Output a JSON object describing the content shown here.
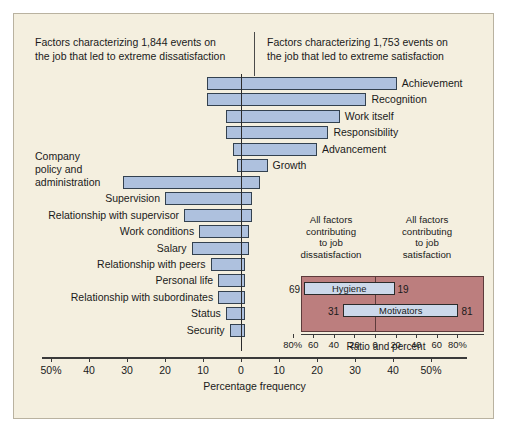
{
  "header": {
    "left": "Factors characterizing 1,844 events on\nthe job that led to extreme dissatisfaction",
    "right": "Factors characterizing 1,753 events on\nthe job that led to extreme satisfaction"
  },
  "axis": {
    "title": "Percentage frequency",
    "ticks": [
      "50%",
      "40",
      "30",
      "20",
      "10",
      "0",
      "10",
      "20",
      "30",
      "40",
      "50%"
    ]
  },
  "inset": {
    "caption_left": "All factors\ncontributing\nto job\ndissatisfaction",
    "caption_right": "All factors\ncontributing\nto job\nsatisfaction",
    "title": "Ratio and percent",
    "ticks": [
      "80%",
      "60",
      "40",
      "20",
      "0",
      "20",
      "40",
      "60",
      "80%"
    ],
    "bars": [
      {
        "label": "Hygiene",
        "left_value": 69,
        "right_value": 19
      },
      {
        "label": "Motivators",
        "left_value": 31,
        "right_value": 81
      }
    ]
  },
  "colors": {
    "panel_background": "#f4efdf",
    "bar_fill": "#aec1de",
    "bar_stroke": "#33414f",
    "inset_background": "#bc7e7e",
    "inset_bar_fill": "#ccd8ea",
    "axis": "#3a3a3a"
  },
  "chart_data": {
    "type": "bar",
    "orientation": "horizontal-diverging",
    "xlabel": "Percentage frequency",
    "ylabel": "",
    "xlim": [
      -50,
      50
    ],
    "grid": false,
    "legend": "none",
    "note": "Each factor spans from a dissatisfaction percentage (left of zero, negative) to a satisfaction percentage (right of zero, positive).",
    "categories": [
      "Achievement",
      "Recognition",
      "Work itself",
      "Responsibility",
      "Advancement",
      "Growth",
      "Company policy and administration",
      "Supervision",
      "Relationship with supervisor",
      "Work conditions",
      "Salary",
      "Relationship with peers",
      "Personal life",
      "Relationship with subordinates",
      "Status",
      "Security"
    ],
    "series": [
      {
        "name": "Dissatisfaction (left of zero, %)",
        "values": [
          9,
          9,
          4,
          4,
          2,
          1,
          31,
          20,
          15,
          11,
          13,
          8,
          6,
          6,
          4,
          3
        ]
      },
      {
        "name": "Satisfaction (right of zero, %)",
        "values": [
          41,
          33,
          26,
          23,
          20,
          7,
          5,
          3,
          3,
          2,
          2,
          1,
          1,
          1,
          1,
          1
        ]
      }
    ],
    "label_side": [
      "right",
      "right",
      "right",
      "right",
      "right",
      "right",
      "left",
      "left",
      "left",
      "left",
      "left",
      "left",
      "left",
      "left",
      "left",
      "left"
    ],
    "inset_chart": {
      "type": "bar",
      "orientation": "horizontal-diverging",
      "title": "Ratio and percent",
      "xlim": [
        -80,
        80
      ],
      "categories": [
        "Hygiene",
        "Motivators"
      ],
      "series": [
        {
          "name": "Contributing to job dissatisfaction (%)",
          "values": [
            69,
            31
          ]
        },
        {
          "name": "Contributing to job satisfaction (%)",
          "values": [
            19,
            81
          ]
        }
      ]
    }
  }
}
